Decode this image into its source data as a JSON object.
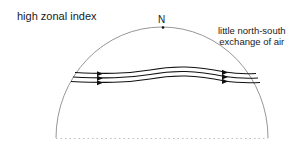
{
  "title": "high zonal index",
  "north_label": "N",
  "note": {
    "line1": "little north-south",
    "line2": "exchange of air"
  },
  "diagram": {
    "hemisphere": {
      "shape": "semicircle",
      "base_style": "dotted",
      "outline_color": "#888888"
    },
    "flow_lines": {
      "count": 3,
      "direction": "west-to-east",
      "pattern": "nearly zonal, gentle undulation",
      "color": "#111111"
    },
    "arrows_per_line": 2
  },
  "colors": {
    "text": "#1a1a1a",
    "outline": "#888888",
    "flow": "#111111"
  }
}
